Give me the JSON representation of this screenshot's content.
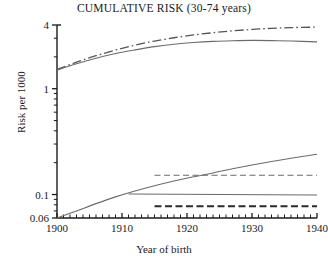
{
  "chart_data": {
    "type": "line",
    "title": "CUMULATIVE RISK (30-74 years)",
    "xlabel": "Year of birth",
    "ylabel": "Risk per 1000",
    "xlim": [
      1900,
      1940
    ],
    "ylim": [
      0.06,
      4
    ],
    "yscale": "log",
    "grid": false,
    "legend": "none",
    "xticks": [
      1900,
      1910,
      1920,
      1930,
      1940
    ],
    "xtick_labels": [
      "1900",
      "1910",
      "1920",
      "1930",
      "1940"
    ],
    "xminor_step": 1,
    "yticks": [
      0.06,
      0.1,
      4
    ],
    "ytick_labels": [
      "0.06",
      "0.1",
      "1",
      "4"
    ],
    "ytick_values": [
      0.06,
      0.1,
      1,
      4
    ],
    "yminor_ticks": [
      0.07,
      0.08,
      0.09,
      0.2,
      0.3,
      0.4,
      0.5,
      0.6,
      0.7,
      0.8,
      0.9,
      2,
      3
    ],
    "series": [
      {
        "name": "upper-dash-dot-curve",
        "style": "dashdot",
        "color": "#555555",
        "x": [
          1900,
          1903,
          1906,
          1909,
          1912,
          1915,
          1918,
          1921,
          1924,
          1927,
          1930,
          1933,
          1936,
          1940
        ],
        "y": [
          1.52,
          1.78,
          2.05,
          2.32,
          2.58,
          2.82,
          3.03,
          3.22,
          3.38,
          3.52,
          3.63,
          3.72,
          3.78,
          3.82
        ]
      },
      {
        "name": "upper-solid-curve",
        "style": "solid",
        "color": "#6b6b6b",
        "x": [
          1900,
          1903,
          1906,
          1909,
          1912,
          1915,
          1918,
          1921,
          1924,
          1927,
          1930,
          1933,
          1936,
          1940
        ],
        "y": [
          1.5,
          1.72,
          1.94,
          2.15,
          2.33,
          2.5,
          2.63,
          2.73,
          2.8,
          2.84,
          2.86,
          2.85,
          2.82,
          2.77
        ]
      },
      {
        "name": "lower-rising-solid-curve",
        "style": "solid",
        "color": "#6b6b6b",
        "x": [
          1900,
          1903,
          1906,
          1909,
          1912,
          1915,
          1918,
          1921,
          1924,
          1927,
          1930,
          1933,
          1936,
          1940
        ],
        "y": [
          0.06,
          0.07,
          0.082,
          0.095,
          0.108,
          0.121,
          0.134,
          0.147,
          0.16,
          0.175,
          0.19,
          0.205,
          0.22,
          0.24
        ]
      },
      {
        "name": "upper-dashed-constant-line",
        "style": "dashed",
        "color": "#6b6b6b",
        "x": [
          1915,
          1940
        ],
        "y": [
          0.152,
          0.152
        ]
      },
      {
        "name": "mid-solid-constant-line",
        "style": "solid",
        "color": "#6b6b6b",
        "x": [
          1911,
          1940
        ],
        "y": [
          0.101,
          0.099
        ]
      },
      {
        "name": "lower-dashed-constant-line",
        "style": "dashed-bold",
        "color": "#2a2a2a",
        "x": [
          1915,
          1940
        ],
        "y": [
          0.0775,
          0.0775
        ]
      }
    ]
  }
}
